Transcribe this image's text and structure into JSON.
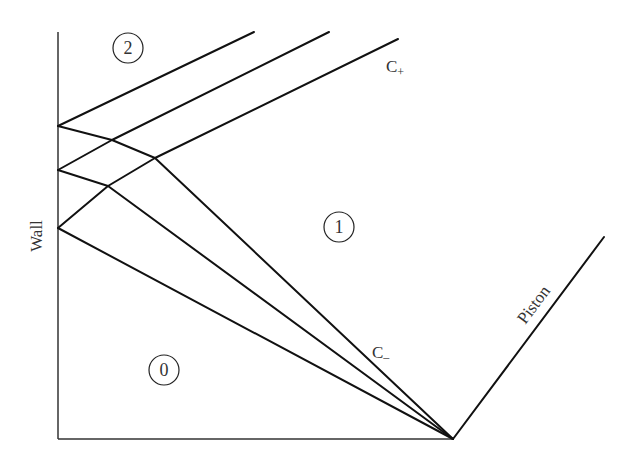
{
  "diagram": {
    "title": "",
    "labels": {
      "wall": "Wall",
      "piston": "Piston",
      "c_plus_base": "C",
      "c_plus_sub": "+",
      "c_minus_base": "C",
      "c_minus_sub": "–"
    },
    "regions": [
      {
        "id": "0",
        "label": "0",
        "cx": 164,
        "cy": 370
      },
      {
        "id": "1",
        "label": "1",
        "cx": 339,
        "cy": 227
      },
      {
        "id": "2",
        "label": "2",
        "cx": 128,
        "cy": 48
      }
    ],
    "axes": {
      "wall_x": 58,
      "wall_top": 32,
      "baseline_y": 439,
      "baseline_right": 453
    },
    "piston": {
      "points": [
        [
          453,
          439
        ],
        [
          604,
          237
        ]
      ]
    },
    "c_minus_waves": [
      {
        "name": "wave-1",
        "points": [
          [
            58,
            126
          ],
          [
            112,
            140
          ],
          [
            155,
            158
          ],
          [
            453,
            439
          ]
        ]
      },
      {
        "name": "wave-2",
        "points": [
          [
            58,
            170
          ],
          [
            108,
            186
          ],
          [
            453,
            439
          ]
        ]
      },
      {
        "name": "wave-3",
        "points": [
          [
            58,
            228
          ],
          [
            453,
            439
          ]
        ]
      }
    ],
    "c_plus_waves": [
      {
        "name": "reflected-1",
        "points": [
          [
            58,
            126
          ],
          [
            254,
            32
          ]
        ]
      },
      {
        "name": "reflected-2",
        "points": [
          [
            58,
            170
          ],
          [
            112,
            140
          ],
          [
            329,
            32
          ]
        ]
      },
      {
        "name": "reflected-3",
        "points": [
          [
            58,
            228
          ],
          [
            108,
            186
          ],
          [
            155,
            158
          ],
          [
            398,
            39
          ]
        ]
      }
    ],
    "colors": {
      "line": "#111111",
      "text": "#333333",
      "background": "#ffffff"
    }
  }
}
